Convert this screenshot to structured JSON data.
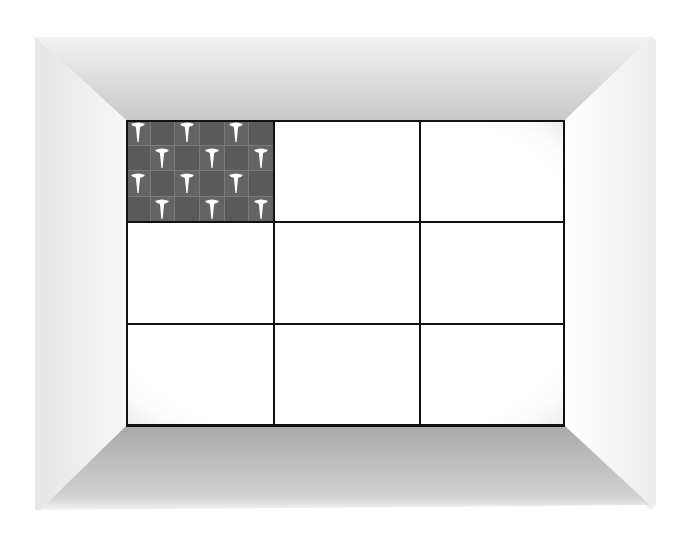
{
  "scene": {
    "type": "room-grid",
    "colors": {
      "background": "#ffffff",
      "ceiling_shade": "#c8c8c8",
      "floor_shade": "#a8a8a8",
      "wall_left_shade": "#dddddd",
      "wall_right_shade": "#f0f0f0",
      "grid_line": "#111111",
      "tile_bg": "#5e5e5e",
      "tile_glyph": "#ffffff"
    }
  },
  "grid": {
    "rows": 3,
    "cols": 3,
    "cells": [
      {
        "row": 0,
        "col": 0,
        "filled": true,
        "pattern": "t-glyph-checker"
      },
      {
        "row": 0,
        "col": 1,
        "filled": false
      },
      {
        "row": 0,
        "col": 2,
        "filled": false
      },
      {
        "row": 1,
        "col": 0,
        "filled": false
      },
      {
        "row": 1,
        "col": 1,
        "filled": false
      },
      {
        "row": 1,
        "col": 2,
        "filled": false
      },
      {
        "row": 2,
        "col": 0,
        "filled": false
      },
      {
        "row": 2,
        "col": 1,
        "filled": false
      },
      {
        "row": 2,
        "col": 2,
        "filled": false
      }
    ]
  },
  "tile_pattern": {
    "subrows": 4,
    "subcols": 6,
    "glyph_icon": "t-shape-icon"
  }
}
